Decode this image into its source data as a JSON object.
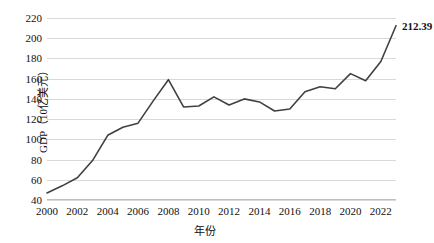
{
  "chart_data": {
    "type": "line",
    "title": "",
    "xlabel": "年份",
    "ylabel": "GDP（10亿美元）",
    "xlim": [
      2000,
      2023
    ],
    "ylim": [
      40,
      220
    ],
    "grid": true,
    "legend": "none",
    "x": [
      2000,
      2001,
      2002,
      2003,
      2004,
      2005,
      2006,
      2007,
      2008,
      2009,
      2010,
      2011,
      2012,
      2013,
      2014,
      2015,
      2016,
      2017,
      2018,
      2019,
      2020,
      2021,
      2022,
      2023
    ],
    "xtick_labels": [
      "2000",
      "2002",
      "2004",
      "2006",
      "2008",
      "2010",
      "2012",
      "2014",
      "2016",
      "2018",
      "2020",
      "2022"
    ],
    "xtick_values": [
      2000,
      2002,
      2004,
      2006,
      2008,
      2010,
      2012,
      2014,
      2016,
      2018,
      2020,
      2022
    ],
    "ytick_labels": [
      "40",
      "60",
      "80",
      "100",
      "120",
      "140",
      "160",
      "180",
      "200",
      "220"
    ],
    "ytick_values": [
      40,
      60,
      80,
      100,
      120,
      140,
      160,
      180,
      200,
      220
    ],
    "series": [
      {
        "name": "GDP",
        "color": "#404040",
        "values": [
          47,
          54,
          62,
          79,
          104,
          112,
          116,
          138,
          159,
          132,
          133,
          142,
          134,
          140,
          137,
          128,
          130,
          147,
          152,
          150,
          165,
          158,
          177,
          212.39
        ]
      }
    ],
    "annotations": [
      {
        "name": "last-value-label",
        "text": "212.39",
        "x": 2023,
        "y": 212.39
      }
    ]
  },
  "colors": {
    "line": "#404040",
    "grid": "#d9d9d9",
    "axis": "#bfbfbf",
    "text": "#111111",
    "background": "#ffffff"
  }
}
